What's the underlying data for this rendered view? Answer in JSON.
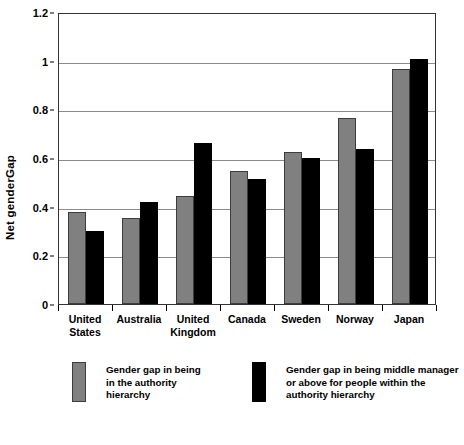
{
  "chart_data": {
    "type": "bar",
    "title": "",
    "xlabel": "",
    "ylabel": "Net genderGap",
    "ylim": [
      0,
      1.2
    ],
    "ytick_values": [
      0,
      0.2,
      0.4,
      0.6,
      0.8,
      1,
      1.2
    ],
    "ytick_labels": [
      "0",
      "0.2",
      "0.4",
      "0.6",
      "0.8",
      "1",
      "1.2"
    ],
    "grid": true,
    "legend_position": "bottom",
    "categories": [
      "United States",
      "Australia",
      "United Kingdom",
      "Canada",
      "Sweden",
      "Norway",
      "Japan"
    ],
    "series": [
      {
        "name": "Gender gap in being in the authority hierarchy",
        "color": "#808080",
        "values": [
          0.38,
          0.355,
          0.445,
          0.545,
          0.625,
          0.765,
          0.965
        ]
      },
      {
        "name": "Gender gap in being middle manager or above for people within the authority hierarchy",
        "color": "#000000",
        "values": [
          0.3,
          0.42,
          0.66,
          0.515,
          0.6,
          0.635,
          1.005
        ]
      }
    ]
  },
  "axes": {
    "y_title": "Net genderGap"
  },
  "legend": {
    "entries": [
      {
        "swatch": "grey-swatch",
        "label": "Gender gap in being\nin the authority\nhierarchy"
      },
      {
        "swatch": "black-swatch",
        "label": "Gender gap in being middle manager\nor above for people within the\nauthority hierarchy"
      }
    ]
  }
}
